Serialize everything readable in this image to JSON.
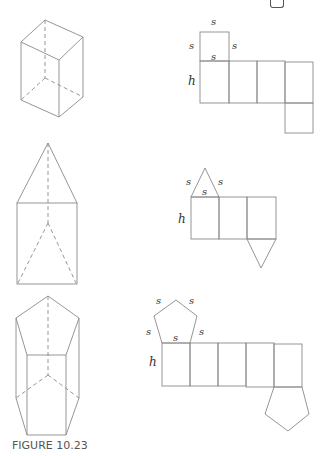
{
  "caption": "FIGURE 10.23",
  "labels": {
    "side": "s",
    "height": "h"
  },
  "figures": [
    {
      "name": "rectangular-prism",
      "net": "rectangular-prism-net",
      "base_sides": 4
    },
    {
      "name": "triangular-prism",
      "net": "triangular-prism-net",
      "base_sides": 3
    },
    {
      "name": "pentagonal-prism",
      "net": "pentagonal-prism-net",
      "base_sides": 5
    }
  ],
  "colors": {
    "line": "#8a8a8a",
    "text": "#333333",
    "caption": "#555555"
  }
}
